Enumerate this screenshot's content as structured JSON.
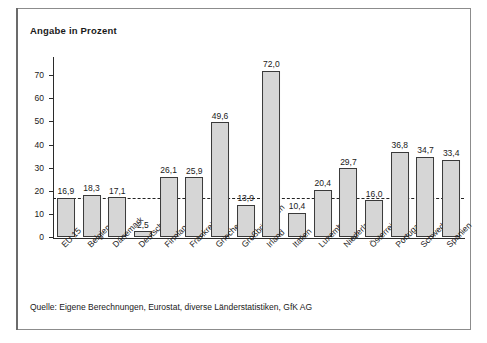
{
  "figure": {
    "title": "Angabe in Prozent",
    "source": "Quelle: Eigene Berechnungen, Eurostat, diverse Länderstatistiken, GfK AG"
  },
  "style": {
    "bar_fill": "#d6d6d6",
    "bar_stroke": "#3a3a3a",
    "axis_color": "#2b2b2b",
    "frame_color": "#8c8c8c",
    "refline_color": "#222222",
    "text_color": "#1a1a1a"
  },
  "chart_data": {
    "type": "bar",
    "title": "Angabe in Prozent",
    "xlabel": "",
    "ylabel": "",
    "ylim": [
      0,
      77
    ],
    "yticks": [
      0,
      10,
      20,
      30,
      40,
      50,
      60,
      70
    ],
    "ytick_labels": [
      "0",
      "10",
      "20",
      "30",
      "40",
      "50",
      "60",
      "70"
    ],
    "grid": false,
    "legend": null,
    "value_label_format": "german-decimal-comma",
    "reference_line": {
      "value": 16.9,
      "label": "EU 15",
      "style": "dashed"
    },
    "categories": [
      "EU 15",
      "Belgien",
      "Dänemark",
      "Deutschland",
      "Finnland",
      "Frankreich",
      "Griechenland",
      "Großbritannien",
      "Irland",
      "Italien",
      "Luxemburg",
      "Niederlande",
      "Österreich",
      "Portugal",
      "Schweden",
      "Spanien"
    ],
    "values": [
      16.9,
      18.3,
      17.1,
      2.5,
      26.1,
      25.9,
      49.6,
      13.9,
      72.0,
      10.4,
      20.4,
      29.7,
      16.0,
      36.8,
      34.7,
      33.4
    ],
    "value_labels": [
      "16,9",
      "18,3",
      "17,1",
      "2,5",
      "26,1",
      "25,9",
      "49,6",
      "13,9",
      "72,0",
      "10,4",
      "20,4",
      "29,7",
      "16,0",
      "36,8",
      "34,7",
      "33,4"
    ]
  }
}
